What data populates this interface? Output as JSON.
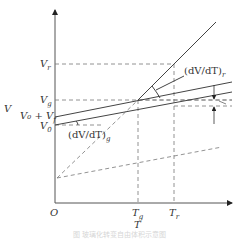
{
  "diagram": {
    "type": "specific-volume vs temperature (glass transition)",
    "axes": {
      "x_label": "T",
      "y_label": "V",
      "origin_label": "O"
    },
    "x_ticks": [
      {
        "label": "T",
        "sub": "g"
      },
      {
        "label": "T",
        "sub": "r"
      }
    ],
    "y_ticks": [
      {
        "label": "V",
        "sub": "r"
      },
      {
        "label": "V",
        "sub": "g"
      },
      {
        "label": "V₀ + V",
        "sub": "f"
      },
      {
        "label": "V",
        "sub": "0"
      }
    ],
    "annotations": [
      {
        "label": "(dV/dT)",
        "sub": "r"
      },
      {
        "label": "(dV/dT)",
        "sub": "g"
      }
    ],
    "caption": "图 玻璃化转变自由体积示意图",
    "colors": {
      "line": "#555555",
      "dash": "#666666",
      "text": "#333333"
    }
  }
}
